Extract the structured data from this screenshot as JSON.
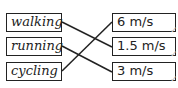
{
  "left_items": [
    {
      "label": "walking"
    },
    {
      "label": "running"
    },
    {
      "label": "cycling"
    }
  ],
  "right_items": [
    {
      "label": "6 m/s"
    },
    {
      "label": "1.5 m/s"
    },
    {
      "label": "3 m/s"
    }
  ],
  "matches": [
    {
      "from": "walking",
      "to": "1.5 m/s"
    },
    {
      "from": "running",
      "to": "3 m/s"
    },
    {
      "from": "cycling",
      "to": "6 m/s"
    }
  ],
  "check_mark": "✓"
}
